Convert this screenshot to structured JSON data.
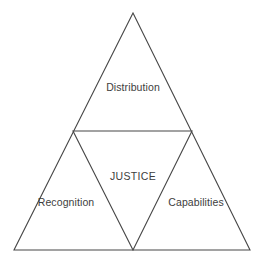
{
  "diagram": {
    "type": "nested-triangle-framework",
    "title": "JUSTICE",
    "background_color": "#ffffff",
    "line_color": "#474747",
    "text_color": "#3d3d3d",
    "geometry": {
      "apex": [
        133,
        13
      ],
      "bottom_left": [
        14,
        250
      ],
      "bottom_right": [
        250,
        250
      ],
      "mid_left": [
        73,
        131
      ],
      "mid_right": [
        192,
        131
      ],
      "mid_bottom": [
        133,
        250
      ]
    },
    "center_label": "JUSTICE",
    "regions": [
      {
        "id": "top",
        "label": "Distribution",
        "position": "top-triangle"
      },
      {
        "id": "bottom-left",
        "label": "Recognition",
        "position": "bottom-left-triangle"
      },
      {
        "id": "bottom-right",
        "label": "Capabilities",
        "position": "bottom-right-triangle"
      },
      {
        "id": "center",
        "label": "JUSTICE",
        "position": "central-inverted-triangle"
      }
    ]
  }
}
